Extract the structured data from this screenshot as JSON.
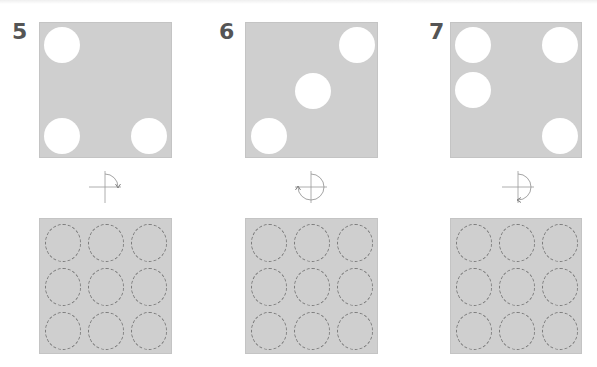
{
  "puzzles": [
    {
      "number": "5",
      "rotation": {
        "degrees": 90,
        "direction": "clockwise",
        "icon": "rotate-90-cw-icon"
      },
      "holes": [
        {
          "row": 0,
          "col": 0
        },
        {
          "row": 2,
          "col": 0
        },
        {
          "row": 2,
          "col": 2
        }
      ]
    },
    {
      "number": "6",
      "rotation": {
        "degrees": 270,
        "direction": "clockwise",
        "icon": "rotate-270-cw-icon"
      },
      "holes": [
        {
          "row": 0,
          "col": 2
        },
        {
          "row": 1,
          "col": 1
        },
        {
          "row": 2,
          "col": 0
        }
      ]
    },
    {
      "number": "7",
      "rotation": {
        "degrees": 180,
        "direction": "clockwise",
        "icon": "rotate-180-cw-icon"
      },
      "holes": [
        {
          "row": 0,
          "col": 0
        },
        {
          "row": 0,
          "col": 2
        },
        {
          "row": 1,
          "col": 0
        },
        {
          "row": 2,
          "col": 2
        }
      ]
    }
  ],
  "answer_grid": {
    "rows": 3,
    "cols": 3,
    "slot_style": "dashed-circle"
  },
  "colors": {
    "panel": "#cfcfcf",
    "hole": "#ffffff",
    "number": "#555555",
    "slot_border": "#7a7a7a",
    "icon_line": "#9a9a9a"
  }
}
